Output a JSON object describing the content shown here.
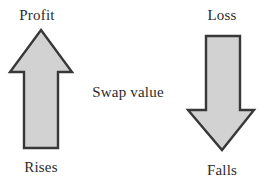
{
  "figure": {
    "type": "concept-diagram",
    "background_color": "#ffffff",
    "width": 259,
    "height": 185,
    "center_caption": "Swap value"
  },
  "left_branch": {
    "top_label": "Profit",
    "bottom_label": "Rises",
    "arrow": {
      "icon": "arrow-up-icon",
      "direction": "up",
      "fill_color": "#d2d2d2",
      "stroke_color": "#383838",
      "stroke_width": 2
    }
  },
  "right_branch": {
    "top_label": "Loss",
    "bottom_label": "Falls",
    "arrow": {
      "icon": "arrow-down-icon",
      "direction": "down",
      "fill_color": "#d2d2d2",
      "stroke_color": "#383838",
      "stroke_width": 2
    }
  }
}
